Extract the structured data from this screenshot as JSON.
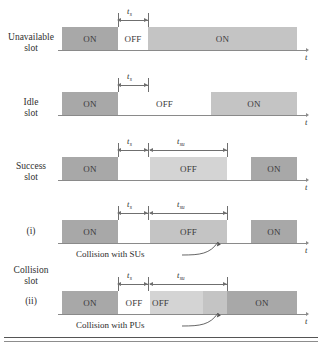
{
  "figure": {
    "axis_label": "t",
    "rows": [
      {
        "id": "unavailable",
        "label": "Unavailable\nslot",
        "segments": [
          {
            "text": "ON",
            "tone": "dark"
          },
          {
            "text": "OFF",
            "tone": "white"
          },
          {
            "text": "ON",
            "tone": "mid"
          }
        ],
        "dims": [
          {
            "label": "t",
            "sub": "s"
          }
        ]
      },
      {
        "id": "idle",
        "label": "Idle\nslot",
        "segments": [
          {
            "text": "ON",
            "tone": "dark"
          },
          {
            "text": "OFF",
            "tone": "white"
          },
          {
            "text": "ON",
            "tone": "mid"
          }
        ],
        "dims": [
          {
            "label": "t",
            "sub": "s"
          }
        ]
      },
      {
        "id": "success",
        "label": "Success\nslot",
        "segments": [
          {
            "text": "ON",
            "tone": "dark"
          },
          {
            "text": "",
            "tone": "white"
          },
          {
            "text": "OFF",
            "tone": "light"
          },
          {
            "text": "",
            "tone": "white"
          },
          {
            "text": "ON",
            "tone": "dark"
          }
        ],
        "dims": [
          {
            "label": "t",
            "sub": "s"
          },
          {
            "label": "t",
            "sub": "su"
          }
        ]
      },
      {
        "id": "collision-i",
        "label": "(i)",
        "segments": [
          {
            "text": "ON",
            "tone": "dark"
          },
          {
            "text": "",
            "tone": "white"
          },
          {
            "text": "OFF",
            "tone": "mid"
          },
          {
            "text": "",
            "tone": "white"
          },
          {
            "text": "ON",
            "tone": "dark"
          }
        ],
        "dims": [
          {
            "label": "t",
            "sub": "s"
          },
          {
            "label": "t",
            "sub": "su"
          }
        ],
        "annotation": "Collision with SUs"
      },
      {
        "id": "collision-ii",
        "label": "(ii)",
        "segments": [
          {
            "text": "ON",
            "tone": "dark"
          },
          {
            "text": "OFF",
            "tone": "white"
          },
          {
            "text": "",
            "tone": "light"
          },
          {
            "text": "",
            "tone": "mid"
          },
          {
            "text": "ON",
            "tone": "dark"
          }
        ],
        "dims": [
          {
            "label": "t",
            "sub": "s"
          },
          {
            "label": "t",
            "sub": "su"
          }
        ],
        "annotation": "Collision with PUs"
      }
    ],
    "group_label": "Collision\nslot"
  }
}
